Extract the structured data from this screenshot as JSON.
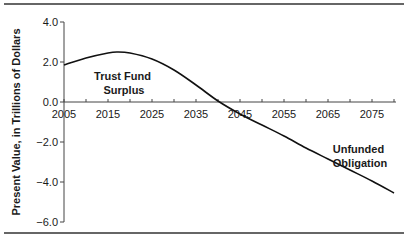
{
  "chart_data": {
    "type": "line",
    "title": "",
    "xlabel": "",
    "ylabel": "Present Value, in Trillions of Dollars",
    "xlim": [
      2005,
      2080
    ],
    "ylim": [
      -6.0,
      4.0
    ],
    "grid": false,
    "legend": null,
    "x_ticks": [
      2005,
      2010,
      2015,
      2020,
      2025,
      2030,
      2035,
      2040,
      2045,
      2050,
      2055,
      2060,
      2065,
      2070,
      2075,
      2080
    ],
    "x_tick_labels": [
      "2005",
      "2015",
      "2025",
      "2035",
      "2045",
      "2055",
      "2065",
      "2075"
    ],
    "y_tick_labels": [
      "4.0",
      "2.0",
      "0.0",
      "-2.0",
      "-4.0",
      "-6.0"
    ],
    "y_ticks": [
      4.0,
      2.0,
      0.0,
      -2.0,
      -4.0,
      -6.0
    ],
    "series": [
      {
        "name": "Trust fund present value",
        "x": [
          2005,
          2010,
          2015,
          2017,
          2020,
          2025,
          2030,
          2035,
          2040,
          2045,
          2050,
          2055,
          2060,
          2065,
          2070,
          2075,
          2080
        ],
        "values": [
          1.85,
          2.2,
          2.45,
          2.5,
          2.45,
          2.15,
          1.6,
          0.85,
          0.05,
          -0.6,
          -1.15,
          -1.7,
          -2.3,
          -2.85,
          -3.4,
          -3.95,
          -4.55
        ]
      }
    ],
    "annotations": [
      {
        "text": "Trust Fund Surplus",
        "lines": [
          "Trust Fund",
          "Surplus"
        ],
        "x": 2020,
        "y": 1.0
      },
      {
        "text": "Unfunded Obligation",
        "lines": [
          "Unfunded",
          "Obligation"
        ],
        "x": 2073,
        "y": -3.0
      }
    ]
  },
  "labels": {
    "ylabel": "Present Value, in Trillions of Dollars",
    "annot1_line1": "Trust Fund",
    "annot1_line2": "Surplus",
    "annot2_line1": "Unfunded",
    "annot2_line2": "Obligation"
  }
}
